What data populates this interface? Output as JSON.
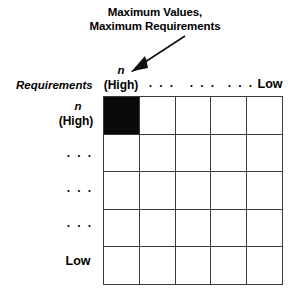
{
  "figure": {
    "name": "requirements-values-matrix",
    "callout": {
      "line1": "Maximum Values,",
      "line2": "Maximum Requirements",
      "arrow_icon": "arrow-down-left-icon"
    },
    "column_axis": {
      "name": "Requirements",
      "head_symbol": "n",
      "head_value": "(High)",
      "dots": [
        "· · ·",
        "· · ·",
        "· · ·"
      ],
      "tail_value": "Low"
    },
    "row_axis": {
      "head_symbol": "n",
      "head_value": "(High)",
      "dots": [
        "· · ·",
        "· · ·",
        "· · ·"
      ],
      "tail_value": "Low"
    },
    "grid": {
      "rows": 5,
      "columns": 5,
      "fill_color": "#0a0a0a",
      "empty_color": "#ffffff",
      "line_color": "#3a3a3a",
      "cells": [
        [
          1,
          0,
          0,
          0,
          0
        ],
        [
          0,
          0,
          0,
          0,
          0
        ],
        [
          0,
          0,
          0,
          0,
          0
        ],
        [
          0,
          0,
          0,
          0,
          0
        ],
        [
          0,
          0,
          0,
          0,
          0
        ]
      ]
    }
  }
}
